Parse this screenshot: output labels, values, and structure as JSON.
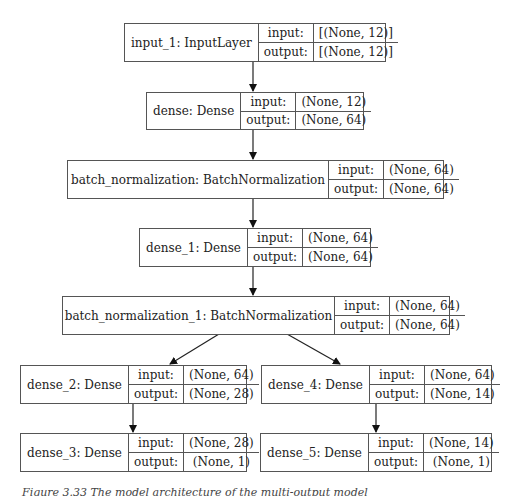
{
  "nodes": [
    {
      "id": "input_1",
      "name": "input_1: InputLayer",
      "input_label": "input:",
      "output_label": "output:",
      "input_shape": "[(None, 12)]",
      "output_shape": "[(None, 12)]"
    },
    {
      "id": "dense",
      "name": "dense: Dense",
      "input_label": "input:",
      "output_label": "output:",
      "input_shape": "(None, 12)",
      "output_shape": "(None, 64)"
    },
    {
      "id": "batch_normalization",
      "name": "batch_normalization: BatchNormalization",
      "input_label": "input:",
      "output_label": "output:",
      "input_shape": "(None, 64)",
      "output_shape": "(None, 64)"
    },
    {
      "id": "dense_1",
      "name": "dense_1: Dense",
      "input_label": "input:",
      "output_label": "output:",
      "input_shape": "(None, 64)",
      "output_shape": "(None, 64)"
    },
    {
      "id": "batch_normalization_1",
      "name": "batch_normalization_1: BatchNormalization",
      "input_label": "input:",
      "output_label": "output:",
      "input_shape": "(None, 64)",
      "output_shape": "(None, 64)"
    },
    {
      "id": "dense_2",
      "name": "dense_2: Dense",
      "input_label": "input:",
      "output_label": "output:",
      "input_shape": "(None, 64)",
      "output_shape": "(None, 28)"
    },
    {
      "id": "dense_4",
      "name": "dense_4: Dense",
      "input_label": "input:",
      "output_label": "output:",
      "input_shape": "(None, 64)",
      "output_shape": "(None, 14)"
    },
    {
      "id": "dense_3",
      "name": "dense_3: Dense",
      "input_label": "input:",
      "output_label": "output:",
      "input_shape": "(None, 28)",
      "output_shape": "(None, 1)"
    },
    {
      "id": "dense_5",
      "name": "dense_5: Dense",
      "input_label": "input:",
      "output_label": "output:",
      "input_shape": "(None, 14)",
      "output_shape": "(None, 1)"
    }
  ],
  "edges": [
    [
      "input_1",
      "dense"
    ],
    [
      "dense",
      "batch_normalization"
    ],
    [
      "batch_normalization",
      "dense_1"
    ],
    [
      "dense_1",
      "batch_normalization_1"
    ],
    [
      "batch_normalization_1",
      "dense_2"
    ],
    [
      "batch_normalization_1",
      "dense_4"
    ],
    [
      "dense_2",
      "dense_3"
    ],
    [
      "dense_4",
      "dense_5"
    ]
  ],
  "caption": "Figure 3.33  The model architecture of the multi-output model"
}
